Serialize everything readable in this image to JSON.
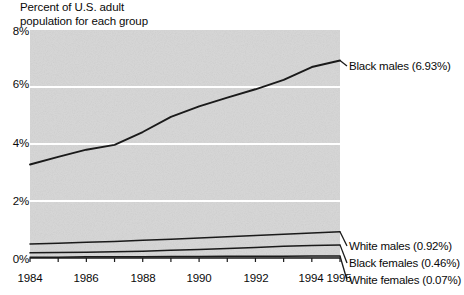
{
  "chart_data": {
    "type": "line",
    "title": "Percent of U.S. adult\npopulation for each group",
    "xlabel": "",
    "ylabel": "",
    "ylim": [
      0,
      8
    ],
    "xlim": [
      1984,
      1995
    ],
    "grid": true,
    "legend_position": "right-inline",
    "ytick_labels": [
      "8%",
      "6%",
      "4%",
      "2%",
      "0%"
    ],
    "ytick_values": [
      8,
      6,
      4,
      2,
      0
    ],
    "xtick_labels": [
      "1984",
      "1986",
      "1988",
      "1990",
      "1992",
      "1994",
      "1995"
    ],
    "xtick_values": [
      1984,
      1986,
      1988,
      1990,
      1992,
      1994,
      1995
    ],
    "x": [
      1984,
      1985,
      1986,
      1987,
      1988,
      1989,
      1990,
      1991,
      1992,
      1993,
      1994,
      1995
    ],
    "series": [
      {
        "name": "Black males",
        "label": "Black males (6.93%)",
        "final_value": 6.93,
        "color": "#1a1a1a",
        "values": [
          3.28,
          3.55,
          3.8,
          3.97,
          4.42,
          4.95,
          5.32,
          5.63,
          5.92,
          6.25,
          6.7,
          6.93
        ]
      },
      {
        "name": "White males",
        "label": "White males (0.92%)",
        "final_value": 0.92,
        "color": "#1a1a1a",
        "values": [
          0.49,
          0.52,
          0.55,
          0.58,
          0.62,
          0.66,
          0.7,
          0.75,
          0.79,
          0.83,
          0.88,
          0.92
        ]
      },
      {
        "name": "Black females",
        "label": "Black females (0.46%)",
        "final_value": 0.46,
        "color": "#1a1a1a",
        "values": [
          0.18,
          0.19,
          0.2,
          0.22,
          0.24,
          0.27,
          0.3,
          0.33,
          0.37,
          0.41,
          0.44,
          0.46
        ]
      },
      {
        "name": "White females",
        "label": "White females (0.07%)",
        "final_value": 0.07,
        "color": "#1a1a1a",
        "values": [
          0.03,
          0.03,
          0.04,
          0.04,
          0.04,
          0.05,
          0.05,
          0.06,
          0.06,
          0.06,
          0.07,
          0.07
        ]
      }
    ],
    "colors": {
      "plot_background": "#d6d6d6",
      "gridline": "#ffffff",
      "line": "#1a1a1a",
      "text": "#0a0a0a",
      "page_background": "#ffffff"
    }
  }
}
